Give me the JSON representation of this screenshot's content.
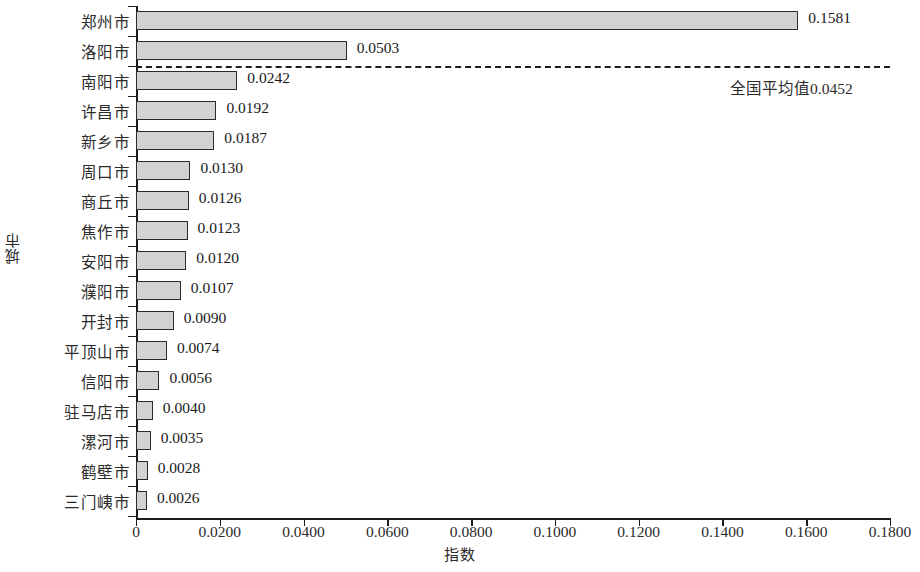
{
  "chart_data": {
    "type": "bar",
    "orientation": "horizontal",
    "title": "",
    "xlabel": "指数",
    "ylabel": "城市",
    "xlim": [
      0,
      0.18
    ],
    "xticks": [
      "0",
      "0.0200",
      "0.0400",
      "0.0600",
      "0.0800",
      "0.1000",
      "0.1200",
      "0.1400",
      "0.1600",
      "0.1800"
    ],
    "xtick_values": [
      0,
      0.02,
      0.04,
      0.06,
      0.08,
      0.1,
      0.12,
      0.14,
      0.16,
      0.18
    ],
    "grid": false,
    "legend": false,
    "bar_color": "#d2d2d2",
    "bar_edge_color": "#2a2a2a",
    "categories": [
      "郑州市",
      "洛阳市",
      "南阳市",
      "许昌市",
      "新乡市",
      "周口市",
      "商丘市",
      "焦作市",
      "安阳市",
      "濮阳市",
      "开封市",
      "平顶山市",
      "信阳市",
      "驻马店市",
      "漯河市",
      "鹤壁市",
      "三门峓市"
    ],
    "values": [
      0.1581,
      0.0503,
      0.0242,
      0.0192,
      0.0187,
      0.013,
      0.0126,
      0.0123,
      0.012,
      0.0107,
      0.009,
      0.0074,
      0.0056,
      0.004,
      0.0035,
      0.0028,
      0.0026
    ],
    "value_labels": [
      "0.1581",
      "0.0503",
      "0.0242",
      "0.0192",
      "0.0187",
      "0.0130",
      "0.0126",
      "0.0123",
      "0.0120",
      "0.0107",
      "0.0090",
      "0.0074",
      "0.0056",
      "0.0040",
      "0.0035",
      "0.0028",
      "0.0026"
    ],
    "annotations": [
      {
        "name": "national-average-line",
        "text": "全国平均值0.0452",
        "value": 0.0452,
        "style": "dashed-horizontal-separator",
        "after_category_index": 1
      }
    ]
  }
}
